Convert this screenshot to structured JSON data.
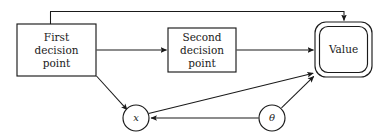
{
  "diagram": {
    "background_color": "#ffffff",
    "line_color": "#1a1a1a",
    "nodes": [
      {
        "id": "first-decision-point",
        "shape": "rectangle",
        "lines": [
          "First",
          "decision",
          "point"
        ],
        "x": 17,
        "y": 24,
        "w": 79,
        "h": 52
      },
      {
        "id": "second-decision-point",
        "shape": "rectangle",
        "lines": [
          "Second",
          "decision",
          "point"
        ],
        "x": 168,
        "y": 28,
        "w": 68,
        "h": 44
      },
      {
        "id": "value",
        "shape": "double-rounded-rectangle",
        "lines": [
          "Value"
        ],
        "x": 315,
        "y": 22,
        "w": 57,
        "h": 55
      },
      {
        "id": "x-variable",
        "shape": "circle",
        "lines": [
          "x"
        ],
        "cx": 136,
        "cy": 118,
        "r": 13
      },
      {
        "id": "theta-variable",
        "shape": "circle",
        "lines": [
          "θ"
        ],
        "cx": 272,
        "cy": 118,
        "r": 13
      }
    ],
    "edges": [
      {
        "id": "first-to-value-feedback",
        "from": "first-decision-point",
        "to": "value",
        "route": "top-loop",
        "arrow": true
      },
      {
        "id": "first-to-second",
        "from": "first-decision-point",
        "to": "second-decision-point",
        "route": "horizontal",
        "arrow": true
      },
      {
        "id": "second-to-value",
        "from": "second-decision-point",
        "to": "value",
        "route": "horizontal",
        "arrow": true
      },
      {
        "id": "first-to-x",
        "from": "first-decision-point",
        "to": "x-variable",
        "route": "diagonal",
        "arrow": true
      },
      {
        "id": "x-to-value",
        "from": "x-variable",
        "to": "value",
        "route": "diagonal",
        "arrow": true
      },
      {
        "id": "theta-to-value",
        "from": "theta-variable",
        "to": "value",
        "route": "diagonal",
        "arrow": true
      },
      {
        "id": "theta-to-x",
        "from": "theta-variable",
        "to": "x-variable",
        "route": "horizontal",
        "arrow": true
      }
    ]
  }
}
